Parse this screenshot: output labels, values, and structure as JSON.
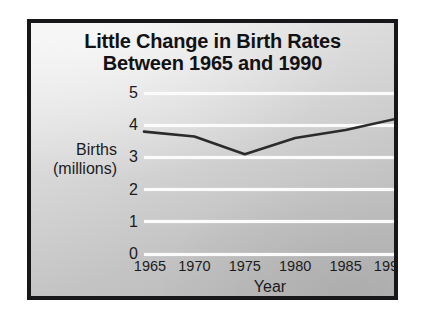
{
  "figure": {
    "title_line_1": "Little Change in Birth Rates",
    "title_line_2": "Between 1965 and 1990",
    "y_axis_title_line_1": "Births",
    "y_axis_title_line_2": "(millions)",
    "x_axis_title": "Year",
    "frame_border_color": "#17171a",
    "gridline_color": "#fbfbfb",
    "line_color": "#2b2b2e",
    "text_color": "#1b1b1d"
  },
  "chart_data": {
    "type": "line",
    "title": "Little Change in Birth Rates Between 1965 and 1990",
    "xlabel": "Year",
    "ylabel": "Births (millions)",
    "x": [
      1965,
      1970,
      1975,
      1980,
      1985,
      1990
    ],
    "categories": [
      "1965",
      "1970",
      "1975",
      "1980",
      "1985",
      "1990"
    ],
    "values": [
      3.8,
      3.65,
      3.1,
      3.6,
      3.85,
      4.2
    ],
    "series": [
      {
        "name": "Births (millions)",
        "values": [
          3.8,
          3.65,
          3.1,
          3.6,
          3.85,
          4.2
        ]
      }
    ],
    "xlim": [
      1965,
      1990
    ],
    "ylim": [
      0,
      5
    ],
    "yticks": [
      5,
      4,
      3,
      2,
      1,
      0
    ],
    "ytick_labels": [
      "5",
      "4",
      "3",
      "2",
      "1",
      "0"
    ],
    "xticks": [
      1965,
      1970,
      1975,
      1980,
      1985,
      1990
    ],
    "xtick_labels": [
      "1965",
      "1970",
      "1975",
      "1980",
      "1985",
      "1990"
    ],
    "grid": true,
    "grid_axis": "y",
    "legend": false,
    "legend_position": "none",
    "markers": false,
    "annotations": []
  }
}
